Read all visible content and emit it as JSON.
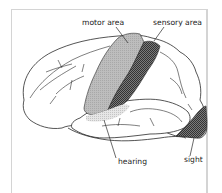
{
  "diagram": {
    "type": "brain-lateral-view",
    "labels": {
      "motor": "motor area",
      "sensory": "sensory area",
      "hearing": "hearing",
      "sight": "sight"
    },
    "colors": {
      "motor_fill": "#b9b9b9",
      "sensory_fill": "#555555",
      "hearing_fill": "#d9d9d9",
      "sight_fill": "#6a6a6a",
      "outline": "#2a2a2a",
      "frame": "#d4d4d4"
    }
  }
}
